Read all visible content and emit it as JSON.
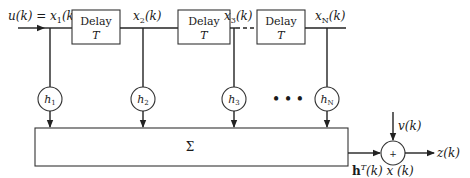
{
  "diagram": {
    "type": "block-diagram",
    "input_label": "u(k) = x",
    "input_sub": "1",
    "input_suffix": "(k)",
    "delays": [
      {
        "line1": "Delay",
        "line2": "T"
      },
      {
        "line1": "Delay",
        "line2": "T"
      },
      {
        "line1": "Delay",
        "line2": "T"
      }
    ],
    "taps": [
      {
        "signal": "x",
        "signal_sub": "2",
        "signal_suffix": "(k)",
        "coef": "h",
        "coef_sub": "1"
      },
      {
        "signal": "x",
        "signal_sub": "3",
        "signal_suffix": "(k)",
        "coef": "h",
        "coef_sub": "2"
      },
      {
        "signal": "x",
        "signal_sub": "N",
        "signal_suffix": "(k)",
        "coef": "h",
        "coef_sub": "3"
      },
      {
        "coef": "h",
        "coef_sub": "N"
      }
    ],
    "ellipsis": "• • •",
    "sum_block": "Σ",
    "adder_symbol": "+",
    "noise_label": "v(k)",
    "output_label": "z(k)",
    "inner_product_label": "h",
    "inner_product_sup": "T",
    "inner_product_rest": "(k) x (k)"
  }
}
